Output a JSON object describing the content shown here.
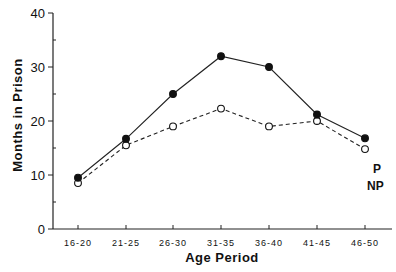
{
  "chart_data": {
    "type": "line",
    "title": "",
    "xlabel": "Age Period",
    "ylabel": "Months in Prison",
    "categories": [
      "16-20",
      "21-25",
      "26-30",
      "31-35",
      "36-40",
      "41-45",
      "46-50"
    ],
    "series": [
      {
        "name": "P",
        "marker": "filled-circle",
        "line": "solid",
        "values": [
          9.5,
          16.7,
          25,
          32,
          30,
          21.2,
          16.8
        ]
      },
      {
        "name": "NP",
        "marker": "open-circle",
        "line": "dashed",
        "values": [
          8.5,
          15.5,
          19,
          22.3,
          19,
          20,
          14.8
        ]
      }
    ],
    "ylim": [
      0,
      40
    ],
    "yticks": [
      0,
      10,
      20,
      30,
      40
    ],
    "y_minor_ticks": [
      5,
      15,
      25,
      35
    ],
    "grid": false,
    "legend": "direct labels at right end of each line"
  },
  "labels": {
    "xlabel": "Age Period",
    "ylabel": "Months in Prison",
    "series_p": "P",
    "series_np": "NP"
  }
}
